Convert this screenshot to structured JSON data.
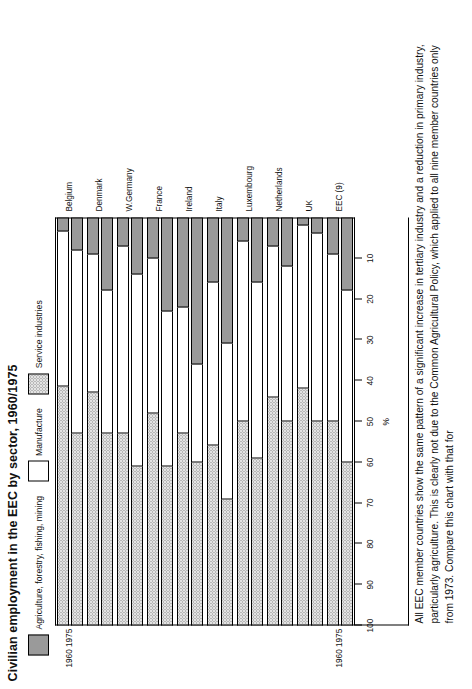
{
  "chart_data": {
    "type": "bar",
    "orientation": "horizontal-stacked",
    "title": "Civilian employment in the EEC by sector, 1960/1975",
    "xlabel": "",
    "ylabel": "%",
    "ylim": [
      0,
      100
    ],
    "yticks": [
      100,
      90,
      80,
      70,
      60,
      50,
      40,
      30,
      20,
      10
    ],
    "grid": false,
    "legend_position": "top",
    "legend": [
      {
        "key": "agriculture",
        "label": "Agriculture, forestry, fishing, mining",
        "color": "#9a9a9a",
        "fill": "solid-grey"
      },
      {
        "key": "manufacture",
        "label": "Manufacture",
        "color": "#ffffff",
        "fill": "white"
      },
      {
        "key": "service",
        "label": "Service industries",
        "color": "#e3e3e3",
        "fill": "stippled-dots"
      }
    ],
    "series": [
      {
        "name": "Agriculture, forestry, fishing, mining",
        "values_1960": [
          8,
          18,
          14,
          23,
          36,
          31,
          16,
          12,
          4,
          18
        ],
        "values_1975": [
          3.5,
          9,
          7,
          10,
          22,
          16,
          6,
          7,
          2,
          9
        ]
      },
      {
        "name": "Manufacture",
        "values_1960": [
          45,
          35,
          47,
          38,
          24,
          38,
          43,
          38,
          46,
          42
        ],
        "values_1975": [
          38,
          34,
          46,
          38,
          31,
          40,
          44,
          37,
          40,
          41
        ]
      },
      {
        "name": "Service industries",
        "values_1960": [
          47,
          47,
          39,
          39,
          40,
          31,
          41,
          50,
          50,
          40
        ],
        "values_1975": [
          58.5,
          57,
          47,
          52,
          47,
          44,
          50,
          56,
          58,
          50
        ]
      }
    ],
    "categories": [
      "Belgium",
      "Denmark",
      "W.Germany",
      "France",
      "Ireland",
      "Italy",
      "Luxembourg",
      "Netherlands",
      "UK",
      "EEC (9)"
    ],
    "year_labels": {
      "lower": "1960",
      "upper": "1975",
      "combined": "1960 1975"
    },
    "bars": [
      {
        "country": "Belgium",
        "year": "1960",
        "service": 47,
        "manufacture": 45,
        "agriculture": 8
      },
      {
        "country": "Belgium",
        "year": "1975",
        "service": 58.5,
        "manufacture": 38,
        "agriculture": 3.5
      },
      {
        "country": "Denmark",
        "year": "1960",
        "service": 47,
        "manufacture": 35,
        "agriculture": 18
      },
      {
        "country": "Denmark",
        "year": "1975",
        "service": 57,
        "manufacture": 34,
        "agriculture": 9
      },
      {
        "country": "W.Germany",
        "year": "1960",
        "service": 39,
        "manufacture": 47,
        "agriculture": 14
      },
      {
        "country": "W.Germany",
        "year": "1975",
        "service": 47,
        "manufacture": 46,
        "agriculture": 7
      },
      {
        "country": "France",
        "year": "1960",
        "service": 39,
        "manufacture": 38,
        "agriculture": 23
      },
      {
        "country": "France",
        "year": "1975",
        "service": 52,
        "manufacture": 38,
        "agriculture": 10
      },
      {
        "country": "Ireland",
        "year": "1960",
        "service": 40,
        "manufacture": 24,
        "agriculture": 36
      },
      {
        "country": "Ireland",
        "year": "1975",
        "service": 47,
        "manufacture": 31,
        "agriculture": 22
      },
      {
        "country": "Italy",
        "year": "1960",
        "service": 31,
        "manufacture": 38,
        "agriculture": 31
      },
      {
        "country": "Italy",
        "year": "1975",
        "service": 44,
        "manufacture": 40,
        "agriculture": 16
      },
      {
        "country": "Luxembourg",
        "year": "1960",
        "service": 41,
        "manufacture": 43,
        "agriculture": 16
      },
      {
        "country": "Luxembourg",
        "year": "1975",
        "service": 50,
        "manufacture": 44,
        "agriculture": 6
      },
      {
        "country": "Netherlands",
        "year": "1960",
        "service": 50,
        "manufacture": 38,
        "agriculture": 12
      },
      {
        "country": "Netherlands",
        "year": "1975",
        "service": 56,
        "manufacture": 37,
        "agriculture": 7
      },
      {
        "country": "UK",
        "year": "1960",
        "service": 50,
        "manufacture": 46,
        "agriculture": 4
      },
      {
        "country": "UK",
        "year": "1975",
        "service": 58,
        "manufacture": 40,
        "agriculture": 2
      },
      {
        "country": "EEC (9)",
        "year": "1960",
        "service": 40,
        "manufacture": 42,
        "agriculture": 18
      },
      {
        "country": "EEC (9)",
        "year": "1975",
        "service": 50,
        "manufacture": 41,
        "agriculture": 9
      }
    ],
    "caption": "All EEC member countries show the same pattern of a significant increase in tertiary industry and a reduction in primary industry, particularly agriculture. This is clearly not due to the Common Agricultural Policy, which applied to all nine member countries only from 1973. Compare this chart with that for"
  }
}
